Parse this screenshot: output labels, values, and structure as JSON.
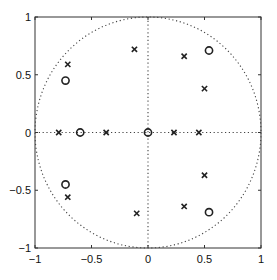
{
  "chart_data": {
    "type": "scatter",
    "title": "",
    "xlabel": "",
    "ylabel": "",
    "xlim": [
      -1,
      1
    ],
    "ylim": [
      -1,
      1
    ],
    "grid": false,
    "legend": null,
    "x_ticks": [
      -1,
      -0.5,
      0,
      0.5,
      1
    ],
    "y_ticks": [
      -1,
      -0.5,
      0,
      0.5,
      1
    ],
    "x_tick_labels": [
      "−1",
      "−0.5",
      "0",
      "0.5",
      "1"
    ],
    "y_tick_labels": [
      "−1",
      "−0.5",
      "0",
      "0.5",
      "1"
    ],
    "annotations": [
      "dotted unit circle",
      "dotted real axis (y=0)",
      "dotted imaginary axis (x=0)"
    ],
    "series": [
      {
        "name": "zeros",
        "marker": "o",
        "points": [
          {
            "x": -0.73,
            "y": 0.45
          },
          {
            "x": 0.54,
            "y": 0.71
          },
          {
            "x": -0.6,
            "y": 0.0
          },
          {
            "x": 0.0,
            "y": 0.0
          },
          {
            "x": -0.73,
            "y": -0.45
          },
          {
            "x": 0.54,
            "y": -0.69
          }
        ]
      },
      {
        "name": "poles",
        "marker": "x",
        "points": [
          {
            "x": -0.71,
            "y": 0.59
          },
          {
            "x": -0.12,
            "y": 0.72
          },
          {
            "x": 0.32,
            "y": 0.66
          },
          {
            "x": 0.5,
            "y": 0.38
          },
          {
            "x": -0.79,
            "y": 0.0
          },
          {
            "x": -0.37,
            "y": 0.0
          },
          {
            "x": 0.23,
            "y": 0.0
          },
          {
            "x": 0.45,
            "y": 0.0
          },
          {
            "x": -0.71,
            "y": -0.56
          },
          {
            "x": -0.1,
            "y": -0.7
          },
          {
            "x": 0.32,
            "y": -0.64
          },
          {
            "x": 0.5,
            "y": -0.37
          }
        ]
      }
    ]
  },
  "colors": {
    "axes": "#333333",
    "marker": "#222222",
    "dotted": "#444444"
  }
}
